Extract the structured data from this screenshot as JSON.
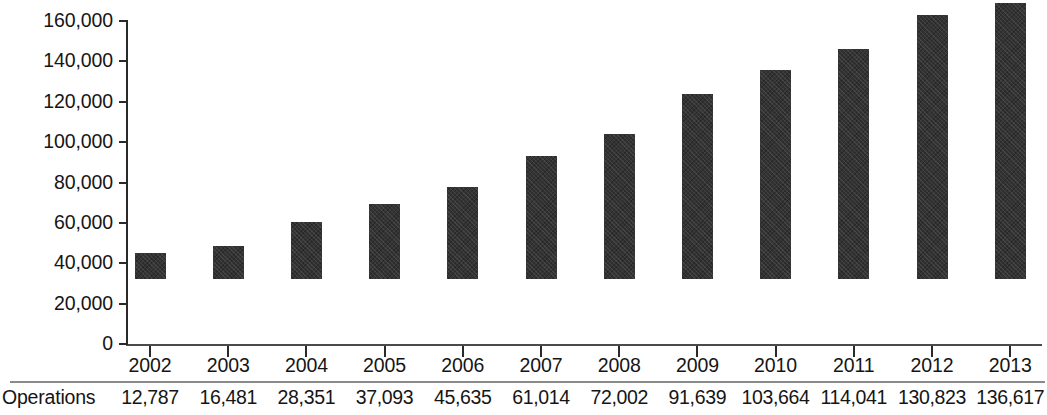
{
  "chart_data": {
    "type": "bar",
    "title": "",
    "subtitle": "",
    "xlabel": "",
    "ylabel": "",
    "categories": [
      "2002",
      "2003",
      "2004",
      "2005",
      "2006",
      "2007",
      "2008",
      "2009",
      "2010",
      "2011",
      "2012",
      "2013"
    ],
    "series": [
      {
        "name": "Operations",
        "values": [
          12787,
          16481,
          28351,
          37093,
          45635,
          61014,
          72002,
          91639,
          103664,
          114041,
          130823,
          136617
        ]
      }
    ],
    "value_labels": [
      "12,787",
      "16,481",
      "28,351",
      "37,093",
      "45,635",
      "61,014",
      "72,002",
      "91,639",
      "103,664",
      "114,041",
      "130,823",
      "136,617"
    ],
    "ylim": [
      0,
      160000
    ],
    "y_ticks": [
      0,
      20000,
      40000,
      60000,
      80000,
      100000,
      120000,
      140000,
      160000
    ],
    "y_tick_labels": [
      "0",
      "20,000",
      "40,000",
      "60,000",
      "80,000",
      "100,000",
      "120,000",
      "140,000",
      "160,000"
    ],
    "grid": false,
    "legend": false,
    "legend_position": "none",
    "bar_color": "#333333",
    "axis_color": "#2a2a2a"
  },
  "table": {
    "row_label": "Operations"
  }
}
